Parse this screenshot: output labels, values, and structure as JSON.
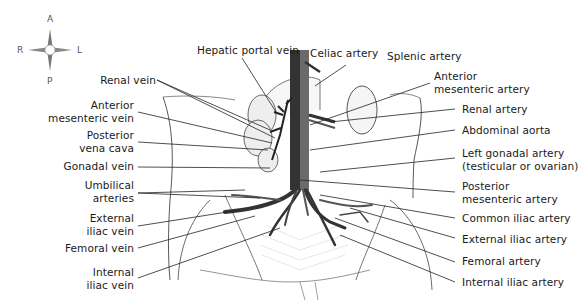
{
  "figure": {
    "colors": {
      "vein": "#3a3a3a",
      "artery": "#6e6e6e",
      "outline": "#333333",
      "leader_line": "#222222",
      "background": "#ffffff"
    }
  },
  "compass": {
    "anterior": "A",
    "posterior": "P",
    "right": "R",
    "left": "L",
    "icon": "compass-rose-icon"
  },
  "labels_left": [
    {
      "id": "renal-vein",
      "lines": [
        "Renal vein"
      ]
    },
    {
      "id": "anterior-mesenteric-vein",
      "lines": [
        "Anterior",
        "mesenteric vein"
      ]
    },
    {
      "id": "posterior-vena-cava",
      "lines": [
        "Posterior",
        "vena cava"
      ]
    },
    {
      "id": "gonadal-vein",
      "lines": [
        "Gonadal vein"
      ]
    },
    {
      "id": "umbilical-arteries",
      "lines": [
        "Umbilical",
        "arteries"
      ]
    },
    {
      "id": "external-iliac-vein",
      "lines": [
        "External",
        "iliac vein"
      ]
    },
    {
      "id": "femoral-vein",
      "lines": [
        "Femoral vein"
      ]
    },
    {
      "id": "internal-iliac-vein",
      "lines": [
        "Internal",
        "iliac vein"
      ]
    }
  ],
  "labels_top": [
    {
      "id": "hepatic-portal-vein",
      "lines": [
        "Hepatic portal vein"
      ]
    },
    {
      "id": "celiac-artery",
      "lines": [
        "Celiac artery"
      ]
    },
    {
      "id": "splenic-artery",
      "lines": [
        "Splenic artery"
      ]
    }
  ],
  "labels_right": [
    {
      "id": "anterior-mesenteric-artery",
      "lines": [
        "Anterior",
        "mesenteric artery"
      ]
    },
    {
      "id": "renal-artery",
      "lines": [
        "Renal artery"
      ]
    },
    {
      "id": "abdominal-aorta",
      "lines": [
        "Abdominal aorta"
      ]
    },
    {
      "id": "left-gonadal-artery",
      "lines": [
        "Left gonadal artery",
        "(testicular or ovarian)"
      ]
    },
    {
      "id": "posterior-mesenteric-artery",
      "lines": [
        "Posterior",
        "mesenteric artery"
      ]
    },
    {
      "id": "common-iliac-artery",
      "lines": [
        "Common iliac artery"
      ]
    },
    {
      "id": "external-iliac-artery",
      "lines": [
        "External iliac artery"
      ]
    },
    {
      "id": "femoral-artery",
      "lines": [
        "Femoral artery"
      ]
    },
    {
      "id": "internal-iliac-artery",
      "lines": [
        "Internal iliac artery"
      ]
    }
  ]
}
